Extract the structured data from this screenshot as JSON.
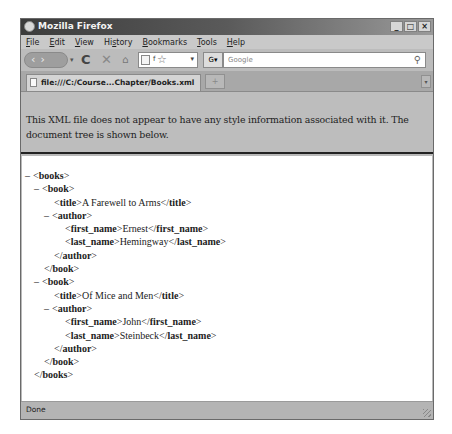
{
  "window": {
    "title": "Mozilla Firefox",
    "controls": {
      "minimize": "_",
      "maximize": "□",
      "close": "×"
    }
  },
  "menubar": {
    "items": [
      {
        "label": "File",
        "accesskey": "F"
      },
      {
        "label": "Edit",
        "accesskey": "E"
      },
      {
        "label": "View",
        "accesskey": "V"
      },
      {
        "label": "History",
        "accesskey": "s"
      },
      {
        "label": "Bookmarks",
        "accesskey": "B"
      },
      {
        "label": "Tools",
        "accesskey": "T"
      },
      {
        "label": "Help",
        "accesskey": "H"
      }
    ]
  },
  "navbar": {
    "back_icon": "‹",
    "forward_icon": "›",
    "history_dropdown_icon": "▾",
    "reload_icon": "C",
    "stop_icon": "✕",
    "home_icon": "⌂",
    "url_value": "f",
    "bookmark_star_icon": "☆",
    "url_dropdown_icon": "▾",
    "search_engine_icon": "G▾",
    "search_placeholder": "Google",
    "search_icon": "⚲"
  },
  "tabs": {
    "items": [
      {
        "label": "file:///C:/Course...Chapter/Books.xml",
        "active": true
      }
    ],
    "new_tab_icon": "+",
    "tab_list_icon": "▾"
  },
  "notice": {
    "text": "This XML file does not appear to have any style information associated with it. The document tree is shown below."
  },
  "xml_tree": {
    "collapse_glyph": "–",
    "lines": [
      {
        "indent": "i0",
        "toggle": "–",
        "markup": "<books>",
        "text": "",
        "close": ""
      },
      {
        "indent": "i1",
        "toggle": "–",
        "markup": "<book>",
        "text": "",
        "close": ""
      },
      {
        "indent": "i2",
        "toggle": "",
        "markup": "<title>",
        "text": "A Farewell to Arms",
        "close": "</title>"
      },
      {
        "indent": "i3",
        "toggle": "–",
        "markup": "<author>",
        "text": "",
        "close": ""
      },
      {
        "indent": "i4",
        "toggle": "",
        "markup": "<first_name>",
        "text": "Ernest",
        "close": "</first_name>"
      },
      {
        "indent": "i4",
        "toggle": "",
        "markup": "<last_name>",
        "text": "Hemingway",
        "close": "</last_name>"
      },
      {
        "indent": "i2",
        "toggle": "",
        "markup": "</author>",
        "text": "",
        "close": ""
      },
      {
        "indent": "ic",
        "toggle": "",
        "markup": "</book>",
        "text": "",
        "close": ""
      },
      {
        "indent": "i1",
        "toggle": "–",
        "markup": "<book>",
        "text": "",
        "close": ""
      },
      {
        "indent": "i2",
        "toggle": "",
        "markup": "<title>",
        "text": "Of Mice and Men",
        "close": "</title>"
      },
      {
        "indent": "i3",
        "toggle": "–",
        "markup": "<author>",
        "text": "",
        "close": ""
      },
      {
        "indent": "i4",
        "toggle": "",
        "markup": "<first_name>",
        "text": "John",
        "close": "</first_name>"
      },
      {
        "indent": "i4",
        "toggle": "",
        "markup": "<last_name>",
        "text": "Steinbeck",
        "close": "</last_name>"
      },
      {
        "indent": "i2",
        "toggle": "",
        "markup": "</author>",
        "text": "",
        "close": ""
      },
      {
        "indent": "ic",
        "toggle": "",
        "markup": "</book>",
        "text": "",
        "close": ""
      },
      {
        "indent": "ibk",
        "toggle": "",
        "markup": "</books>",
        "text": "",
        "close": ""
      }
    ]
  },
  "statusbar": {
    "text": "Done"
  }
}
